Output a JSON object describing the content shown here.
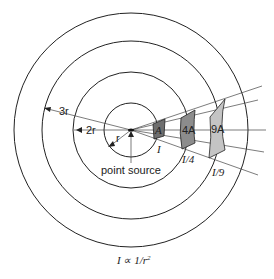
{
  "diagram": {
    "center": {
      "x": 131,
      "y": 130
    },
    "circles": [
      {
        "radius_label": "r",
        "radius_px": 27
      },
      {
        "radius_label": "2r",
        "radius_px": 58
      },
      {
        "radius_label": "3r",
        "radius_px": 89
      },
      {
        "radius_label": "",
        "radius_px": 117
      }
    ],
    "labels": {
      "r": "r",
      "two_r": "2r",
      "three_r": "3r",
      "point_source": "point source",
      "area_1": "A",
      "area_2": "4A",
      "area_3": "9A",
      "intensity_1": "I",
      "intensity_2": "I/4",
      "intensity_3": "I/9",
      "formula": "I ∝ 1/r",
      "formula_exp": "2"
    },
    "patch_colors": {
      "area_1": "#6e6e6e",
      "area_2": "#8c8c8c",
      "area_3": "#c4c4c4"
    },
    "line_color": "#222222"
  }
}
